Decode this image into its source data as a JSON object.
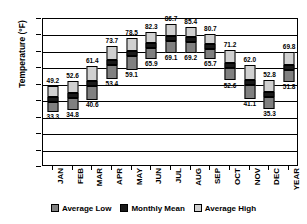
{
  "chart_data": {
    "type": "bar",
    "title": "",
    "subtitle": "",
    "xlabel": "",
    "ylabel": "Temperature (°F)",
    "ylim": [
      0,
      90
    ],
    "ytick_step": 10,
    "yticks": [
      "90",
      "80",
      "70",
      "60",
      "50",
      "40",
      "30",
      "20",
      "10",
      "0"
    ],
    "grid": true,
    "grid_axis": "y",
    "legend_position": "bottom",
    "bar_style": "floating-stacked-range",
    "note": "Each bar spans Average Low to Average High; the black band marks the Monthly Mean. Value labels: Average High above bar, Average Low below bar, Monthly Mean beside the black band.",
    "categories": [
      "JAN",
      "FEB",
      "MAR",
      "APR",
      "MAY",
      "JUN",
      "JUL",
      "AUG",
      "SEP",
      "OCT",
      "NOV",
      "DEC",
      "YEAR"
    ],
    "series": [
      {
        "name": "Average Low",
        "color": "#808080",
        "values": [
          33.3,
          34.8,
          40.6,
          53.4,
          59.1,
          65.9,
          69.1,
          69.2,
          65.7,
          52.6,
          41.1,
          35.3,
          51.8
        ]
      },
      {
        "name": "Monthly Mean",
        "color": "#1a1a1a",
        "values": [
          41.3,
          43.7,
          51.0,
          63.6,
          68.8,
          74.1,
          77.9,
          77.3,
          73.2,
          61.9,
          51.6,
          44.1,
          60.8
        ]
      },
      {
        "name": "Average High",
        "color": "#d0d0d0",
        "values": [
          49.2,
          52.6,
          61.4,
          73.7,
          78.5,
          82.3,
          86.7,
          85.4,
          80.7,
          71.2,
          62.0,
          52.8,
          69.8
        ]
      }
    ],
    "labels": {
      "high": [
        "49.2",
        "52.6",
        "61.4",
        "73.7",
        "78.5",
        "82.3",
        "86.7",
        "85.4",
        "80.7",
        "71.2",
        "62.0",
        "52.8",
        "69.8"
      ],
      "mean": [
        "",
        "",
        "",
        "53.4",
        "59.1",
        "65.9",
        "69.1",
        "69.2",
        "65.7",
        "52.6",
        "41.1",
        "",
        "51.8"
      ],
      "low": [
        "33.3",
        "34.8",
        "40.6",
        "",
        "",
        "",
        "",
        "",
        "",
        "",
        "",
        "35.3",
        ""
      ]
    }
  },
  "legend": {
    "items": [
      {
        "label": "Average Low",
        "color": "#808080"
      },
      {
        "label": "Monthly Mean",
        "color": "#1a1a1a"
      },
      {
        "label": "Average High",
        "color": "#d0d0d0"
      }
    ]
  }
}
